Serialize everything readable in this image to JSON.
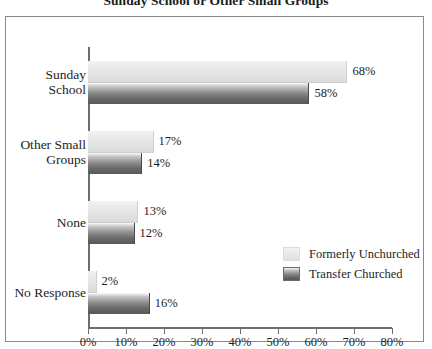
{
  "chart_data": {
    "type": "bar",
    "orientation": "horizontal",
    "title": "Sunday School or Other Small Groups",
    "xlabel": "",
    "ylabel": "",
    "xlim": [
      0,
      80
    ],
    "xticks": [
      0,
      10,
      20,
      30,
      40,
      50,
      60,
      70,
      80
    ],
    "xtick_labels": [
      "0%",
      "10%",
      "20%",
      "30%",
      "40%",
      "50%",
      "60%",
      "70%",
      "80%"
    ],
    "grid": false,
    "legend_position": "inside-right-lower",
    "categories": [
      "Sunday School",
      "Other Small Groups",
      "None",
      "No Response"
    ],
    "series": [
      {
        "name": "Formerly Unchurched",
        "color": "#e6e6e6",
        "values": [
          68,
          17,
          13,
          2
        ],
        "value_labels": [
          "68%",
          "17%",
          "13%",
          "2%"
        ]
      },
      {
        "name": "Transfer Churched",
        "color": "#6e6e6e",
        "values": [
          58,
          14,
          12,
          16
        ],
        "value_labels": [
          "58%",
          "14%",
          "12%",
          "16%"
        ]
      }
    ]
  },
  "colors": {
    "frame": "#8a8a8a",
    "axis": "#6e6e6e",
    "text": "#1e1e1e",
    "light_bar": "#e6e6e6",
    "dark_bar": "#6e6e6e",
    "background": "#ffffff"
  }
}
